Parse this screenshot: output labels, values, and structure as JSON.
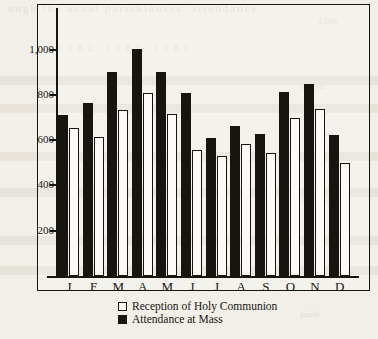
{
  "chart_data": {
    "type": "bar",
    "title": "",
    "subtitle": "",
    "xlabel": "",
    "ylabel": "",
    "categories": [
      "J",
      "F",
      "M",
      "A",
      "M",
      "J",
      "J",
      "A",
      "S",
      "O",
      "N",
      "D"
    ],
    "ylim": [
      0,
      1100
    ],
    "yticks": [
      200,
      400,
      600,
      800,
      1000
    ],
    "ytick_labels": [
      "200",
      "400",
      "600",
      "800",
      "1,000"
    ],
    "grid": false,
    "legend_position": "bottom",
    "series": [
      {
        "name": "Attendance at Mass",
        "style": "filled-black",
        "values": [
          710,
          765,
          900,
          1005,
          900,
          810,
          610,
          665,
          627,
          812,
          850,
          625
        ]
      },
      {
        "name": "Reception of Holy Communion",
        "style": "open-white",
        "values": [
          652,
          613,
          733,
          810,
          715,
          557,
          530,
          582,
          545,
          700,
          740,
          500
        ]
      }
    ]
  },
  "legend": {
    "items": [
      {
        "label": "Reception of Holy Communion",
        "swatch": "open-square-swatch"
      },
      {
        "label": "Attendance at Mass",
        "swatch": "filled-square-swatch"
      }
    ]
  },
  "bleed_text": {
    "line1": "ough the usual parishioners' attendance",
    "line2": "2,000",
    "line3": "1982    1983    1984",
    "line4": "the year",
    "line5": "chaplain",
    "line6": "numbers",
    "line7": "parish"
  }
}
